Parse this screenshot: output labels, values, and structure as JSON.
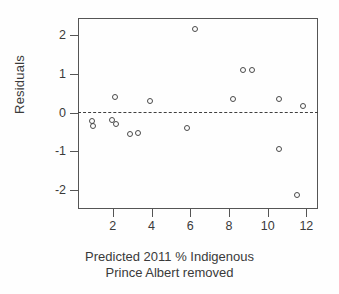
{
  "figure": {
    "kind": "residual-scatter-plot",
    "background": "#ffffff",
    "point_color": "#4a4a4a",
    "axis_color": "#555555",
    "zero_line_color": "#3f3f3f"
  },
  "axes": {
    "y_label": "Residuals",
    "x_label_line1": "Predicted 2011 % Indigenous",
    "x_label_line2": "Prince Albert removed",
    "y_ticks": [
      {
        "value": 2,
        "label": "2"
      },
      {
        "value": 1,
        "label": "1"
      },
      {
        "value": 0,
        "label": "0"
      },
      {
        "value": -1,
        "label": "-1"
      },
      {
        "value": -2,
        "label": "-2"
      }
    ],
    "x_ticks": [
      {
        "value": 2,
        "label": "2"
      },
      {
        "value": 4,
        "label": "4"
      },
      {
        "value": 6,
        "label": "6"
      },
      {
        "value": 8,
        "label": "8"
      },
      {
        "value": 10,
        "label": "10"
      },
      {
        "value": 12,
        "label": "12"
      }
    ]
  },
  "chart_data": {
    "type": "scatter",
    "title": "",
    "xlabel": "Predicted 2011 % Indigenous Prince Albert removed",
    "ylabel": "Residuals",
    "xlim": [
      0.2,
      12.6
    ],
    "ylim": [
      -2.5,
      2.45
    ],
    "grid": false,
    "legend": null,
    "reference_line": {
      "type": "horizontal",
      "y": 0,
      "style": "dashed"
    },
    "marker": "open-circle",
    "points": [
      {
        "x": 0.9,
        "y": -0.22
      },
      {
        "x": 0.97,
        "y": -0.36
      },
      {
        "x": 1.98,
        "y": -0.19
      },
      {
        "x": 2.12,
        "y": 0.4
      },
      {
        "x": 2.18,
        "y": -0.3
      },
      {
        "x": 2.88,
        "y": -0.55
      },
      {
        "x": 3.32,
        "y": -0.52
      },
      {
        "x": 3.92,
        "y": 0.31
      },
      {
        "x": 5.82,
        "y": -0.41
      },
      {
        "x": 6.25,
        "y": 2.17
      },
      {
        "x": 8.2,
        "y": 0.34
      },
      {
        "x": 8.7,
        "y": 1.1
      },
      {
        "x": 9.2,
        "y": 1.1
      },
      {
        "x": 10.6,
        "y": 0.36
      },
      {
        "x": 10.58,
        "y": -0.95
      },
      {
        "x": 11.5,
        "y": -2.13
      },
      {
        "x": 11.8,
        "y": 0.18
      }
    ]
  }
}
